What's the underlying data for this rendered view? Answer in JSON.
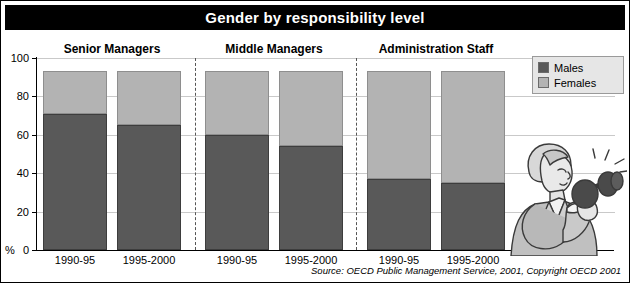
{
  "title": "Gender by responsibility level",
  "source": "Source: OECD Public Management Service, 2001, Copyright OECD 2001",
  "axis": {
    "y_unit": "%",
    "ticks": [
      "0",
      "20",
      "40",
      "60",
      "80",
      "100"
    ]
  },
  "legend": {
    "items": [
      {
        "label": "Males",
        "color": "#595959",
        "icon": "legend-swatch-males"
      },
      {
        "label": "Females",
        "color": "#b3b3b3",
        "icon": "legend-swatch-females"
      }
    ]
  },
  "groups": [
    {
      "name": "Senior Managers"
    },
    {
      "name": "Middle Managers"
    },
    {
      "name": "Administration Staff"
    }
  ],
  "bars": [
    {
      "group": "Senior Managers",
      "period": "1990-95",
      "males": 71,
      "females": 22,
      "total": 93
    },
    {
      "group": "Senior Managers",
      "period": "1995-2000",
      "males": 65,
      "females": 28,
      "total": 93
    },
    {
      "group": "Middle Managers",
      "period": "1990-95",
      "males": 60,
      "females": 33,
      "total": 93
    },
    {
      "group": "Middle Managers",
      "period": "1995-2000",
      "males": 54,
      "females": 39,
      "total": 93
    },
    {
      "group": "Administration Staff",
      "period": "1990-95",
      "males": 37,
      "females": 56,
      "total": 93
    },
    {
      "group": "Administration Staff",
      "period": "1995-2000",
      "males": 35,
      "females": 58,
      "total": 93
    }
  ],
  "chart_data": {
    "type": "bar",
    "title": "Gender by responsibility level",
    "subtitle": "",
    "xlabel": "",
    "ylabel": "%",
    "ylim": [
      0,
      100
    ],
    "yticks": [
      0,
      20,
      40,
      60,
      80,
      100
    ],
    "grid": true,
    "stacked": true,
    "legend_position": "top-right",
    "legend": [
      "Males",
      "Females"
    ],
    "group_labels": [
      "Senior Managers",
      "Middle Managers",
      "Administration Staff"
    ],
    "categories": [
      "Senior Managers 1990-95",
      "Senior Managers 1995-2000",
      "Middle Managers 1990-95",
      "Middle Managers 1995-2000",
      "Administration Staff 1990-95",
      "Administration Staff 1995-2000"
    ],
    "x": [
      "1990-95",
      "1995-2000",
      "1990-95",
      "1995-2000",
      "1990-95",
      "1995-2000"
    ],
    "series": [
      {
        "name": "Males",
        "color": "#595959",
        "values": [
          71,
          65,
          60,
          54,
          37,
          35
        ]
      },
      {
        "name": "Females",
        "color": "#b3b3b3",
        "values": [
          22,
          28,
          33,
          39,
          56,
          58
        ]
      }
    ],
    "totals": [
      93,
      93,
      93,
      93,
      93,
      93
    ],
    "annotations": [
      "Source: OECD Public Management Service, 2001, Copyright OECD 2001"
    ]
  }
}
